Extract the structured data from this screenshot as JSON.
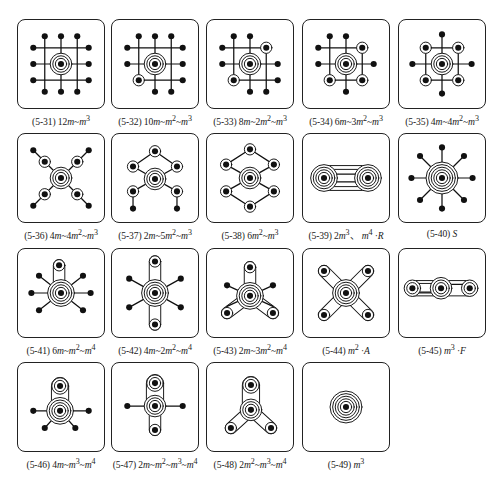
{
  "layout": {
    "columns_x": [
      17,
      111,
      206,
      302,
      398
    ],
    "rows_y": [
      19,
      133,
      248,
      362
    ]
  },
  "figures": [
    {
      "id": "5-31",
      "label": "(5-31) 12m~m³",
      "label_html": "(5-31) 12<i>m</i>~<i>m</i><sup>3</sup>",
      "row": 0,
      "col": 0,
      "lines": [
        [
          16,
          28,
          74,
          28
        ],
        [
          16,
          45,
          74,
          45
        ],
        [
          16,
          62,
          74,
          62
        ],
        [
          28,
          16,
          28,
          74
        ],
        [
          45,
          16,
          45,
          74
        ],
        [
          62,
          16,
          62,
          74
        ]
      ],
      "nodes": [
        [
          28,
          16,
          0
        ],
        [
          45,
          16,
          0
        ],
        [
          62,
          16,
          0
        ],
        [
          16,
          28,
          0
        ],
        [
          74,
          28,
          0
        ],
        [
          16,
          45,
          0
        ],
        [
          74,
          45,
          0
        ],
        [
          16,
          62,
          0
        ],
        [
          74,
          62,
          0
        ],
        [
          28,
          74,
          0
        ],
        [
          45,
          74,
          0
        ],
        [
          62,
          74,
          0
        ],
        [
          45,
          45,
          3
        ]
      ]
    },
    {
      "id": "5-32",
      "label": "(5-32) 10m~m²~m³",
      "label_html": "(5-32) 10<i>m</i>~<i>m</i><sup>2</sup>~<i>m</i><sup>3</sup>",
      "row": 0,
      "col": 1,
      "lines": [
        [
          16,
          28,
          74,
          28
        ],
        [
          16,
          45,
          74,
          45
        ],
        [
          28,
          62,
          74,
          62
        ],
        [
          28,
          16,
          28,
          62
        ],
        [
          45,
          16,
          45,
          74
        ],
        [
          62,
          16,
          62,
          74
        ]
      ],
      "nodes": [
        [
          28,
          16,
          0
        ],
        [
          45,
          16,
          0
        ],
        [
          62,
          16,
          0
        ],
        [
          16,
          28,
          0
        ],
        [
          74,
          28,
          0
        ],
        [
          16,
          45,
          0
        ],
        [
          74,
          45,
          0
        ],
        [
          74,
          62,
          0
        ],
        [
          45,
          74,
          0
        ],
        [
          62,
          74,
          0
        ],
        [
          28,
          62,
          1
        ],
        [
          45,
          45,
          3
        ]
      ]
    },
    {
      "id": "5-33",
      "label": "(5-33) 8m~2m²~m³",
      "label_html": "(5-33) 8<i>m</i>~2<i>m</i><sup>2</sup>~<i>m</i><sup>3</sup>",
      "row": 0,
      "col": 2,
      "lines": [
        [
          16,
          28,
          62,
          28
        ],
        [
          16,
          45,
          74,
          45
        ],
        [
          28,
          62,
          74,
          62
        ],
        [
          28,
          16,
          28,
          62
        ],
        [
          45,
          16,
          45,
          74
        ],
        [
          62,
          28,
          62,
          74
        ]
      ],
      "nodes": [
        [
          28,
          16,
          0
        ],
        [
          45,
          16,
          0
        ],
        [
          16,
          28,
          0
        ],
        [
          16,
          45,
          0
        ],
        [
          74,
          45,
          0
        ],
        [
          74,
          62,
          0
        ],
        [
          45,
          74,
          0
        ],
        [
          62,
          74,
          0
        ],
        [
          62,
          28,
          1
        ],
        [
          28,
          62,
          1
        ],
        [
          45,
          45,
          3
        ]
      ]
    },
    {
      "id": "5-34",
      "label": "(5-34) 6m~3m²~m³",
      "label_html": "(5-34) 6<i>m</i>~3<i>m</i><sup>2</sup>~<i>m</i><sup>3</sup>",
      "row": 0,
      "col": 3,
      "lines": [
        [
          16,
          28,
          62,
          28
        ],
        [
          16,
          45,
          74,
          45
        ],
        [
          28,
          62,
          62,
          62
        ],
        [
          28,
          16,
          28,
          62
        ],
        [
          45,
          16,
          45,
          74
        ],
        [
          62,
          28,
          62,
          62
        ]
      ],
      "nodes": [
        [
          28,
          16,
          0
        ],
        [
          45,
          16,
          0
        ],
        [
          16,
          28,
          0
        ],
        [
          16,
          45,
          0
        ],
        [
          74,
          45,
          0
        ],
        [
          45,
          74,
          0
        ],
        [
          62,
          28,
          1
        ],
        [
          28,
          62,
          1
        ],
        [
          62,
          62,
          1
        ],
        [
          45,
          45,
          3
        ]
      ]
    },
    {
      "id": "5-35",
      "label": "(5-35) 4m~4m²~m³",
      "label_html": "(5-35) 4<i>m</i>~4<i>m</i><sup>2</sup>~<i>m</i><sup>3</sup>",
      "row": 0,
      "col": 4,
      "lines": [
        [
          28,
          28,
          62,
          28
        ],
        [
          14,
          45,
          76,
          45
        ],
        [
          28,
          62,
          62,
          62
        ],
        [
          28,
          28,
          28,
          62
        ],
        [
          45,
          14,
          45,
          76
        ],
        [
          62,
          28,
          62,
          62
        ]
      ],
      "nodes": [
        [
          45,
          14,
          0
        ],
        [
          14,
          45,
          0
        ],
        [
          76,
          45,
          0
        ],
        [
          45,
          76,
          0
        ],
        [
          28,
          28,
          1
        ],
        [
          62,
          28,
          1
        ],
        [
          28,
          62,
          1
        ],
        [
          62,
          62,
          1
        ],
        [
          45,
          45,
          3
        ]
      ]
    },
    {
      "id": "5-36",
      "label": "(5-36) 4m~4m²~m³",
      "label_html": "(5-36) 4<i>m</i>~4<i>m</i><sup>2</sup>~<i>m</i><sup>3</sup>",
      "row": 1,
      "col": 0,
      "lines": [
        [
          16,
          16,
          74,
          74
        ],
        [
          74,
          16,
          16,
          74
        ]
      ],
      "nodes": [
        [
          16,
          16,
          0
        ],
        [
          74,
          16,
          0
        ],
        [
          16,
          74,
          0
        ],
        [
          74,
          74,
          0
        ],
        [
          28,
          28,
          1
        ],
        [
          62,
          28,
          1
        ],
        [
          28,
          62,
          1
        ],
        [
          62,
          62,
          1
        ],
        [
          45,
          45,
          3
        ]
      ]
    },
    {
      "id": "5-37",
      "label": "(5-37) 2m~5m²~m³",
      "label_html": "(5-37) 2<i>m</i>~5<i>m</i><sup>2</sup>~<i>m</i><sup>3</sup>",
      "row": 1,
      "col": 1,
      "lines": [
        [
          45,
          17,
          22,
          33
        ],
        [
          45,
          17,
          68,
          33
        ],
        [
          22,
          33,
          68,
          59
        ],
        [
          68,
          33,
          22,
          59
        ],
        [
          22,
          59,
          22,
          77
        ],
        [
          68,
          59,
          68,
          77
        ]
      ],
      "nodes": [
        [
          45,
          17,
          1
        ],
        [
          22,
          33,
          1
        ],
        [
          68,
          33,
          1
        ],
        [
          22,
          59,
          1
        ],
        [
          68,
          59,
          1
        ],
        [
          22,
          77,
          0
        ],
        [
          68,
          77,
          0
        ],
        [
          45,
          46,
          3
        ]
      ]
    },
    {
      "id": "5-38",
      "label": "(5-38) 6m²~m³",
      "label_html": "(5-38) 6<i>m</i><sup>2</sup>~<i>m</i><sup>3</sup>",
      "row": 1,
      "col": 2,
      "lines": [
        [
          45,
          15,
          20,
          31
        ],
        [
          45,
          15,
          70,
          31
        ],
        [
          20,
          31,
          70,
          59
        ],
        [
          70,
          31,
          20,
          59
        ],
        [
          20,
          59,
          45,
          75
        ],
        [
          70,
          59,
          45,
          75
        ]
      ],
      "nodes": [
        [
          45,
          15,
          1
        ],
        [
          20,
          31,
          1
        ],
        [
          70,
          31,
          1
        ],
        [
          20,
          59,
          1
        ],
        [
          70,
          59,
          1
        ],
        [
          45,
          75,
          1
        ],
        [
          45,
          45,
          3
        ]
      ]
    },
    {
      "id": "5-39",
      "label": "(5-39) 2m³、m⁴·R",
      "label_html": "(5-39) 2<i>m</i><sup>3</sup>、 <i>m</i><sup>4</sup> ·<i>R</i>",
      "row": 1,
      "col": 3,
      "capsules": [
        [
          22,
          45,
          68,
          45,
          13
        ],
        [
          22,
          45,
          68,
          45,
          9
        ]
      ],
      "lines": [
        [
          22,
          41,
          68,
          41
        ],
        [
          22,
          49,
          68,
          49
        ]
      ],
      "nodes": [
        [
          22,
          45,
          4
        ],
        [
          68,
          45,
          4
        ]
      ]
    },
    {
      "id": "5-40",
      "label": "(5-40) S",
      "label_html": "(5-40) <i>S</i>",
      "row": 1,
      "col": 4,
      "lines": [
        [
          45,
          13,
          45,
          77
        ],
        [
          13,
          45,
          77,
          45
        ],
        [
          22,
          22,
          68,
          68
        ],
        [
          68,
          22,
          22,
          68
        ]
      ],
      "nodes": [
        [
          45,
          13,
          0
        ],
        [
          45,
          77,
          0
        ],
        [
          13,
          45,
          0
        ],
        [
          77,
          45,
          0
        ],
        [
          22,
          22,
          0
        ],
        [
          68,
          22,
          0
        ],
        [
          22,
          68,
          0
        ],
        [
          68,
          68,
          0
        ],
        [
          45,
          45,
          5
        ]
      ]
    },
    {
      "id": "5-41",
      "label": "(5-41) 6m~m²~m⁴",
      "label_html": "(5-41) 6<i>m</i>~<i>m</i><sup>2</sup>~<i>m</i><sup>4</sup>",
      "row": 2,
      "col": 0,
      "capsules": [
        [
          43,
          16,
          43,
          45,
          6
        ]
      ],
      "lines": [
        [
          14,
          45,
          76,
          45
        ],
        [
          22,
          27,
          68,
          63
        ],
        [
          68,
          27,
          22,
          63
        ]
      ],
      "nodes": [
        [
          14,
          45,
          0
        ],
        [
          76,
          45,
          0
        ],
        [
          22,
          27,
          0
        ],
        [
          68,
          27,
          0
        ],
        [
          22,
          63,
          0
        ],
        [
          68,
          63,
          0
        ],
        [
          43,
          16,
          1
        ],
        [
          45,
          45,
          4
        ]
      ]
    },
    {
      "id": "5-42",
      "label": "(5-42) 4m~2m²~m⁴",
      "label_html": "(5-42) 4<i>m</i>~2<i>m</i><sup>2</sup>~<i>m</i><sup>4</sup>",
      "row": 2,
      "col": 1,
      "capsules": [
        [
          45,
          12,
          45,
          78,
          6
        ]
      ],
      "lines": [
        [
          18,
          30,
          72,
          60
        ],
        [
          72,
          30,
          18,
          60
        ]
      ],
      "nodes": [
        [
          18,
          30,
          0
        ],
        [
          72,
          30,
          0
        ],
        [
          18,
          60,
          0
        ],
        [
          72,
          60,
          0
        ],
        [
          45,
          12,
          1
        ],
        [
          45,
          78,
          1
        ],
        [
          45,
          45,
          4
        ]
      ]
    },
    {
      "id": "5-43",
      "label": "(5-43) 2m~3m²~m⁴",
      "label_html": "(5-43) 2<i>m</i>~3<i>m</i><sup>2</sup>~<i>m</i><sup>4</sup>",
      "row": 2,
      "col": 2,
      "capsules": [
        [
          45,
          18,
          45,
          48,
          6
        ],
        [
          21,
          66,
          45,
          48,
          6
        ],
        [
          69,
          66,
          45,
          48,
          6
        ]
      ],
      "lines": [
        [
          21,
          37,
          69,
          59
        ],
        [
          69,
          37,
          21,
          59
        ]
      ],
      "nodes": [
        [
          21,
          37,
          0
        ],
        [
          69,
          37,
          0
        ],
        [
          45,
          18,
          1
        ],
        [
          21,
          66,
          1
        ],
        [
          69,
          66,
          1
        ],
        [
          45,
          48,
          4
        ]
      ]
    },
    {
      "id": "5-44",
      "label": "(5-44) m²·A",
      "label_html": "(5-44) <i>m</i><sup>2</sup> ·<i>A</i>",
      "row": 2,
      "col": 3,
      "capsules": [
        [
          22,
          22,
          68,
          68,
          6
        ],
        [
          68,
          22,
          22,
          68,
          6
        ]
      ],
      "lines": [],
      "nodes": [
        [
          22,
          22,
          1
        ],
        [
          68,
          22,
          1
        ],
        [
          22,
          68,
          1
        ],
        [
          68,
          68,
          1
        ],
        [
          45,
          45,
          4
        ]
      ]
    },
    {
      "id": "5-45",
      "label": "(5-45) m³·F",
      "label_html": "(5-45) <i>m</i><sup>3</sup> ·<i>F</i>",
      "row": 2,
      "col": 4,
      "capsules": [
        [
          14,
          40,
          74,
          40,
          8
        ],
        [
          14,
          40,
          44,
          40,
          5
        ]
      ],
      "lines": [
        [
          44,
          36,
          74,
          36
        ],
        [
          14,
          44,
          44,
          44
        ]
      ],
      "nodes": [
        [
          14,
          40,
          2
        ],
        [
          74,
          40,
          2
        ],
        [
          44,
          40,
          3
        ]
      ]
    },
    {
      "id": "5-46",
      "label": "(5-46) 4m~m³~m⁴",
      "label_html": "(5-46) 4<i>m</i>~<i>m</i><sup>3</sup>~<i>m</i><sup>4</sup>",
      "row": 3,
      "col": 0,
      "capsules": [
        [
          44,
          23,
          44,
          49,
          9
        ]
      ],
      "lines": [
        [
          16,
          49,
          74,
          49
        ],
        [
          28,
          67,
          44,
          49
        ],
        [
          60,
          67,
          44,
          49
        ]
      ],
      "nodes": [
        [
          16,
          49,
          0
        ],
        [
          74,
          49,
          0
        ],
        [
          28,
          67,
          0
        ],
        [
          60,
          67,
          0
        ],
        [
          44,
          23,
          2
        ],
        [
          44,
          49,
          4
        ]
      ]
    },
    {
      "id": "5-47",
      "label": "(5-47) 2m~m²~m³~m⁴",
      "label_html": "(5-47) 2<i>m</i>~<i>m</i><sup>2</sup>~<i>m</i><sup>3</sup>~<i>m</i><sup>4</sup>",
      "row": 3,
      "col": 1,
      "capsules": [
        [
          45,
          20,
          45,
          44,
          9
        ],
        [
          45,
          44,
          45,
          69,
          6
        ]
      ],
      "lines": [
        [
          16,
          44,
          74,
          44
        ]
      ],
      "nodes": [
        [
          16,
          44,
          0
        ],
        [
          74,
          44,
          0
        ],
        [
          45,
          20,
          2
        ],
        [
          45,
          69,
          1
        ],
        [
          45,
          44,
          3
        ]
      ]
    },
    {
      "id": "5-48",
      "label": "(5-48) 2m²~m³~m⁴",
      "label_html": "(5-48) 2<i>m</i><sup>2</sup>~<i>m</i><sup>3</sup>~<i>m</i><sup>4</sup>",
      "row": 3,
      "col": 2,
      "capsules": [
        [
          46,
          22,
          46,
          48,
          9
        ],
        [
          25,
          67,
          46,
          48,
          6
        ],
        [
          67,
          67,
          46,
          48,
          6
        ]
      ],
      "lines": [],
      "nodes": [
        [
          46,
          22,
          2
        ],
        [
          25,
          67,
          1
        ],
        [
          67,
          67,
          1
        ],
        [
          46,
          48,
          3
        ]
      ]
    },
    {
      "id": "5-49",
      "label": "(5-49) m³",
      "label_html": "(5-49) <i>m</i><sup>3</sup>",
      "row": 3,
      "col": 3,
      "capsules": [],
      "lines": [],
      "nodes": [
        [
          45,
          45,
          5
        ]
      ]
    }
  ]
}
